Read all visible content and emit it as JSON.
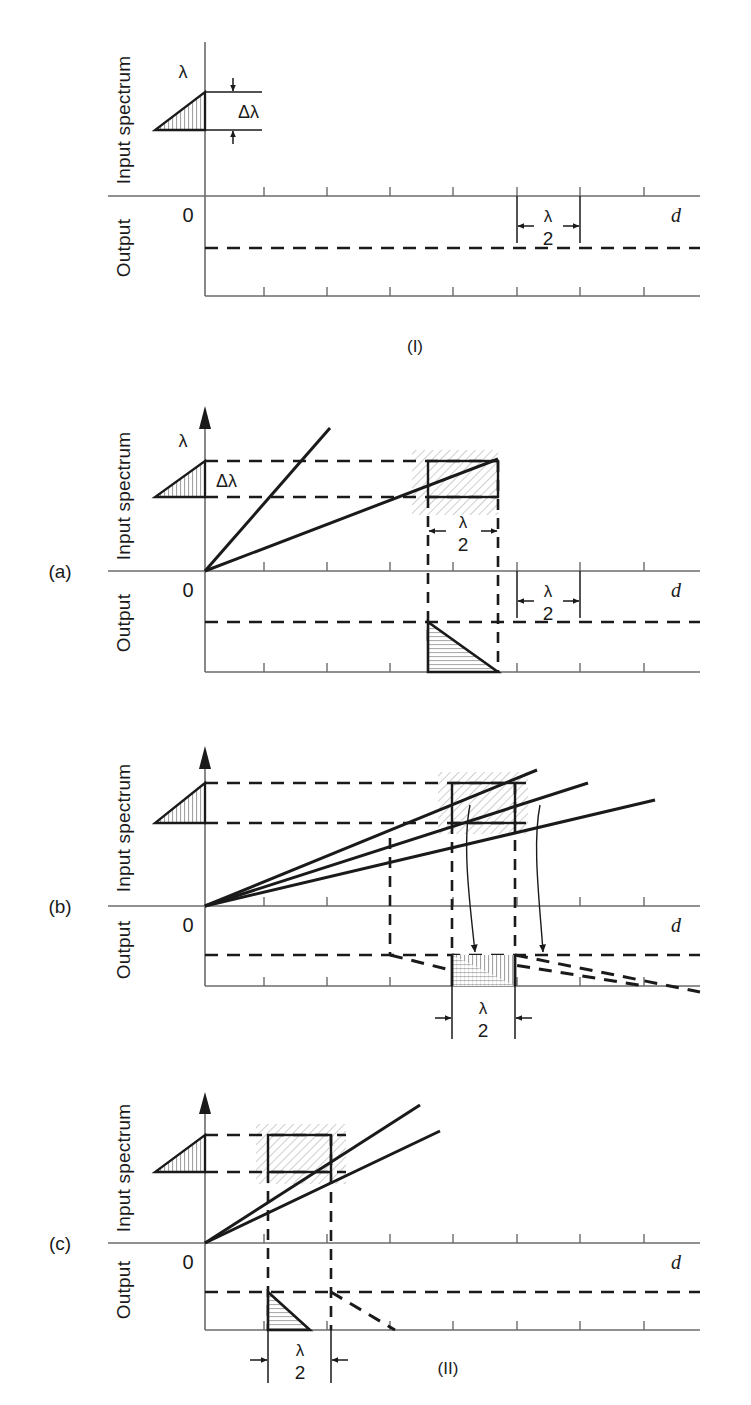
{
  "figure": {
    "type": "technical-diagram",
    "groups": [
      {
        "id": "I",
        "label": "(I)"
      },
      {
        "id": "II",
        "label": "(II)"
      }
    ],
    "panels": [
      {
        "id": "I",
        "tag": "",
        "axis_labels": {
          "top": "Input spectrum",
          "bottom": "Output",
          "x": "d",
          "origin": "0"
        },
        "symbols": {
          "lambda": "λ",
          "delta_lambda": "Δλ"
        },
        "bracket": {
          "numerator": "λ",
          "denominator": "2",
          "label": "λ/2"
        },
        "has_rays": false,
        "has_box": false,
        "has_output_triangle": false
      },
      {
        "id": "a",
        "tag": "(a)",
        "axis_labels": {
          "top": "Input spectrum",
          "bottom": "Output",
          "x": "d",
          "origin": "0"
        },
        "symbols": {
          "lambda": "λ",
          "delta_lambda": "Δλ"
        },
        "bracket": {
          "numerator": "λ",
          "denominator": "2",
          "label": "λ/2"
        },
        "bracket_inner": {
          "numerator": "λ",
          "denominator": "2",
          "label": "λ/2"
        },
        "ray_count": 2,
        "has_box": true,
        "has_output_triangle": true
      },
      {
        "id": "b",
        "tag": "(b)",
        "axis_labels": {
          "top": "Input spectrum",
          "bottom": "Output",
          "x": "d",
          "origin": "0"
        },
        "symbols": {
          "lambda": "λ",
          "delta_lambda": ""
        },
        "bracket": {
          "numerator": "λ",
          "denominator": "2",
          "label": "λ/2"
        },
        "ray_count": 3,
        "has_box": true,
        "has_output_triangle": true,
        "has_curved_arrows": true,
        "curved_arrow_count": 2
      },
      {
        "id": "c",
        "tag": "(c)",
        "axis_labels": {
          "top": "Input spectrum",
          "bottom": "Output",
          "x": "d",
          "origin": "0"
        },
        "symbols": {
          "lambda": "λ",
          "delta_lambda": ""
        },
        "bracket": {
          "numerator": "λ",
          "denominator": "2",
          "label": "λ/2"
        },
        "ray_count": 2,
        "has_box": true,
        "has_output_triangle": true
      }
    ]
  },
  "colors": {
    "ink": "#1a1a1a",
    "axis": "#6b6b6b",
    "hatch": "#9a9a9a",
    "shade": "#c8c8c8",
    "background": "#ffffff"
  },
  "labels": {
    "input_spectrum": "Input spectrum",
    "output": "Output",
    "d": "d",
    "zero": "0",
    "lambda": "λ",
    "delta_lambda": "Δλ",
    "two": "2",
    "tag_a": "(a)",
    "tag_b": "(b)",
    "tag_c": "(c)",
    "group_I": "(I)",
    "group_II": "(II)"
  }
}
